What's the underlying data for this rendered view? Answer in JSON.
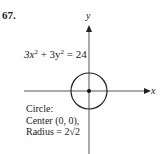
{
  "problem_number": "67.",
  "equation": {
    "a": "3x",
    "exp1": "2",
    "mid": " + 3y",
    "exp2": "2",
    "rhs": " = 24"
  },
  "axes": {
    "x_label": "x",
    "y_label": "y"
  },
  "notes": {
    "line1": "Circle:",
    "line2": "Center (0, 0),",
    "line3": "Radius = 2√2"
  },
  "colors": {
    "ink": "#222222",
    "axis": "#555555"
  }
}
